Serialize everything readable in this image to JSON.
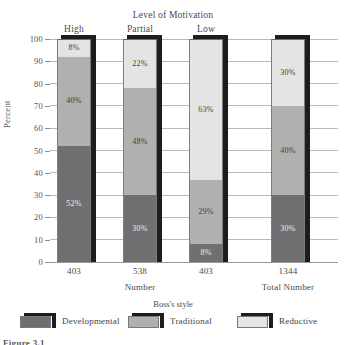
{
  "chart_data": {
    "type": "bar",
    "subtype": "stacked-percent-3d",
    "title": "Level of Motivation",
    "xlabel": "Number",
    "xlabel_secondary": "Total Number",
    "ylabel": "Percent",
    "ylim": [
      0,
      100
    ],
    "yticks": [
      0,
      10,
      20,
      30,
      40,
      50,
      60,
      70,
      80,
      90,
      100
    ],
    "grid": true,
    "legend_title": "Boss's style",
    "legend_position": "bottom",
    "categories": [
      "High",
      "Partial",
      "Low",
      ""
    ],
    "category_counts": [
      "403",
      "538",
      "403",
      "1344"
    ],
    "series": [
      {
        "name": "Developmental",
        "color": "#6f6f6f",
        "values": [
          52,
          30,
          8,
          30
        ],
        "labels": [
          "52%",
          "30%",
          "8%",
          "30%"
        ]
      },
      {
        "name": "Traditional",
        "color": "#b0b0b0",
        "values": [
          40,
          48,
          29,
          40
        ],
        "labels": [
          "40%",
          "48%",
          "29%",
          "40%"
        ]
      },
      {
        "name": "Reductive",
        "color": "#e4e4e4",
        "values": [
          8,
          22,
          63,
          30
        ],
        "labels": [
          "8%",
          "22%",
          "63%",
          "30%"
        ]
      }
    ]
  },
  "figure": {
    "caption": "Figure 3.1"
  }
}
